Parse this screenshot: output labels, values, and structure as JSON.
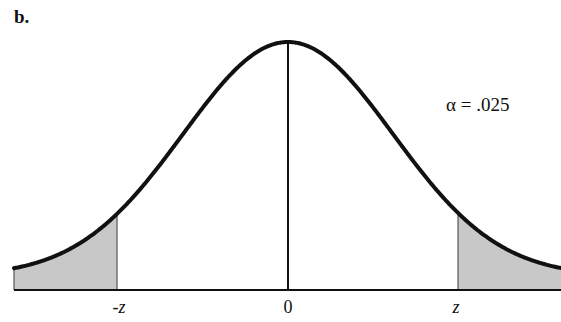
{
  "panel_label": "b.",
  "annotation": "α = .025",
  "axis": {
    "ticks": [
      {
        "label": "-z",
        "position": "left-critical"
      },
      {
        "label": "0",
        "position": "mean"
      },
      {
        "label": "z",
        "position": "right-critical"
      }
    ]
  },
  "colors": {
    "curve": "#111111",
    "shade": "#c8c8c8",
    "axis": "#111111"
  },
  "chart_data": {
    "type": "area",
    "title": "b.",
    "distribution": "normal",
    "mean": 0,
    "shaded_regions": [
      "x < -z",
      "x > z"
    ],
    "alpha_per_tail": 0.025,
    "annotation": "α = .025",
    "tick_labels": [
      "-z",
      "0",
      "z"
    ],
    "xlabel": "",
    "ylabel": "",
    "grid": false
  }
}
